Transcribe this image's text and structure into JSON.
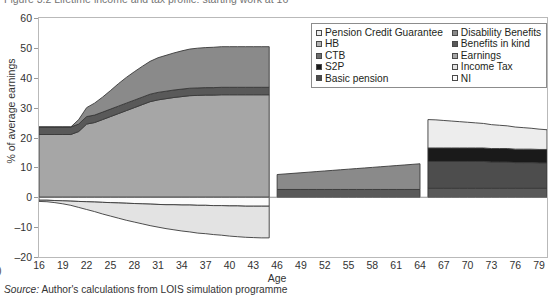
{
  "figure": {
    "caption": "Figure 3.2   Lifetime income and tax profile: starting work at 16",
    "source_prefix": "Source:",
    "source_text": " Author's calculations from LOIS simulation programme",
    "page_marker": ")"
  },
  "chart_data": {
    "type": "area",
    "stacked": true,
    "title": "",
    "xlabel": "Age",
    "ylabel": "% of average earnings",
    "xlim": [
      16,
      80
    ],
    "ylim": [
      -20,
      60
    ],
    "ytick_values": [
      60,
      50,
      40,
      30,
      20,
      10,
      0,
      -10,
      -20
    ],
    "xtick_values": [
      16,
      19,
      22,
      25,
      28,
      31,
      34,
      37,
      40,
      43,
      46,
      49,
      52,
      55,
      58,
      61,
      64,
      67,
      70,
      73,
      76,
      79
    ],
    "grid": false,
    "legend_position": "top-right",
    "colors": {
      "pension_credit_guarantee": "#ededed",
      "hb": "#b3b3b3",
      "ctb": "#6e6e6e",
      "s2p": "#1a1a1a",
      "basic_pension": "#4d4d4d",
      "disability_benefits": "#8a8a8a",
      "benefits_in_kind": "#595959",
      "earnings": "#a6a6a6",
      "income_tax": "#e3e3e3",
      "ni": "#fbfbfb",
      "outline": "#3a3a3a",
      "frame": "#b9b9b9"
    },
    "x": [
      16,
      17,
      18,
      19,
      20,
      21,
      22,
      23,
      24,
      25,
      26,
      27,
      28,
      29,
      30,
      31,
      32,
      33,
      34,
      35,
      36,
      37,
      38,
      39,
      40,
      41,
      42,
      43,
      44,
      45,
      46,
      47,
      48,
      49,
      50,
      51,
      52,
      53,
      54,
      55,
      56,
      57,
      58,
      59,
      60,
      61,
      62,
      63,
      64,
      65,
      66,
      67,
      68,
      69,
      70,
      71,
      72,
      73,
      74,
      75,
      76,
      77,
      78,
      79,
      80
    ],
    "series": [
      {
        "name": "Earnings",
        "key": "earnings",
        "values": [
          21.0,
          21.0,
          21.0,
          21.0,
          21.0,
          22.0,
          24.5,
          25.0,
          26.0,
          27.0,
          28.0,
          29.0,
          30.0,
          31.0,
          32.0,
          32.6,
          33.0,
          33.4,
          33.7,
          34.0,
          34.1,
          34.2,
          34.2,
          34.3,
          34.3,
          34.3,
          34.3,
          34.3,
          34.3,
          34.3,
          0,
          0,
          0,
          0,
          0,
          0,
          0,
          0,
          0,
          0,
          0,
          0,
          0,
          0,
          0,
          0,
          0,
          0,
          0,
          0,
          0,
          0,
          0,
          0,
          0,
          0,
          0,
          0,
          0,
          0,
          0,
          0,
          0,
          0,
          0
        ]
      },
      {
        "name": "Benefits in kind",
        "key": "benefits_in_kind",
        "values": [
          2.5,
          2.5,
          2.5,
          2.5,
          2.5,
          2.5,
          2.5,
          2.5,
          2.5,
          2.5,
          2.5,
          2.5,
          2.5,
          2.5,
          2.5,
          2.5,
          2.5,
          2.5,
          2.5,
          2.5,
          2.5,
          2.5,
          2.5,
          2.5,
          2.5,
          2.5,
          2.5,
          2.5,
          2.5,
          2.5,
          2.6,
          2.6,
          2.6,
          2.6,
          2.6,
          2.6,
          2.6,
          2.6,
          2.6,
          2.6,
          2.6,
          2.6,
          2.6,
          2.6,
          2.6,
          2.6,
          2.6,
          2.6,
          2.6,
          3.0,
          3.0,
          3.0,
          3.0,
          3.0,
          3.0,
          3.0,
          3.0,
          3.0,
          3.0,
          3.0,
          3.0,
          3.0,
          3.0,
          3.0,
          3.0
        ]
      },
      {
        "name": "Disability Benefits",
        "key": "disability_benefits",
        "values": [
          0,
          0,
          0,
          0,
          0,
          1.5,
          3.0,
          4.0,
          5.0,
          6.2,
          7.5,
          8.6,
          9.5,
          10.3,
          11.0,
          11.6,
          12.0,
          12.4,
          12.8,
          13.1,
          13.3,
          13.4,
          13.5,
          13.6,
          13.6,
          13.6,
          13.6,
          13.6,
          13.6,
          13.6,
          5.0,
          5.2,
          5.4,
          5.6,
          5.8,
          6.0,
          6.2,
          6.4,
          6.6,
          6.8,
          7.0,
          7.2,
          7.4,
          7.6,
          7.8,
          8.0,
          8.2,
          8.4,
          8.6,
          0,
          0,
          0,
          0,
          0,
          0,
          0,
          0,
          0,
          0,
          0,
          0,
          0,
          0,
          0,
          0
        ]
      },
      {
        "name": "Basic pension",
        "key": "basic_pension",
        "values": [
          0,
          0,
          0,
          0,
          0,
          0,
          0,
          0,
          0,
          0,
          0,
          0,
          0,
          0,
          0,
          0,
          0,
          0,
          0,
          0,
          0,
          0,
          0,
          0,
          0,
          0,
          0,
          0,
          0,
          0,
          0,
          0,
          0,
          0,
          0,
          0,
          0,
          0,
          0,
          0,
          0,
          0,
          0,
          0,
          0,
          0,
          0,
          0,
          0,
          9.0,
          9.0,
          9.0,
          9.0,
          9.0,
          9.0,
          9.0,
          9.0,
          8.8,
          8.8,
          8.8,
          8.6,
          8.6,
          8.6,
          8.5,
          8.5
        ]
      },
      {
        "name": "S2P",
        "key": "s2p",
        "values": [
          0,
          0,
          0,
          0,
          0,
          0,
          0,
          0,
          0,
          0,
          0,
          0,
          0,
          0,
          0,
          0,
          0,
          0,
          0,
          0,
          0,
          0,
          0,
          0,
          0,
          0,
          0,
          0,
          0,
          0,
          0,
          0,
          0,
          0,
          0,
          0,
          0,
          0,
          0,
          0,
          0,
          0,
          0,
          0,
          0,
          0,
          0,
          0,
          0,
          4.5,
          4.5,
          4.5,
          4.5,
          4.5,
          4.5,
          4.5,
          4.5,
          4.5,
          4.5,
          4.5,
          4.5,
          4.5,
          4.5,
          4.5,
          4.5
        ]
      },
      {
        "name": "Pension Credit Guarantee",
        "key": "pension_credit_guarantee",
        "values": [
          0,
          0,
          0,
          0,
          0,
          0,
          0,
          0,
          0,
          0,
          0,
          0,
          0,
          0,
          0,
          0,
          0,
          0,
          0,
          0,
          0,
          0,
          0,
          0,
          0,
          0,
          0,
          0,
          0,
          0,
          0,
          0,
          0,
          0,
          0,
          0,
          0,
          0,
          0,
          0,
          0,
          0,
          0,
          0,
          0,
          0,
          0,
          0,
          0,
          9.5,
          9.4,
          9.2,
          9.0,
          8.8,
          8.6,
          8.4,
          8.2,
          8.0,
          7.8,
          7.6,
          7.4,
          7.2,
          7.0,
          6.8,
          6.6
        ]
      },
      {
        "name": "HB",
        "key": "hb",
        "values": [
          0,
          0,
          0,
          0,
          0,
          0,
          0,
          0,
          0,
          0,
          0,
          0,
          0,
          0,
          0,
          0,
          0,
          0,
          0,
          0,
          0,
          0,
          0,
          0,
          0,
          0,
          0,
          0,
          0,
          0,
          0,
          0,
          0,
          0,
          0,
          0,
          0,
          0,
          0,
          0,
          0,
          0,
          0,
          0,
          0,
          0,
          0,
          0,
          0,
          0,
          0,
          0,
          0,
          0,
          0,
          0,
          0,
          0,
          0,
          0,
          0,
          0,
          0,
          0,
          0
        ]
      },
      {
        "name": "CTB",
        "key": "ctb",
        "values": [
          0,
          0,
          0,
          0,
          0,
          0,
          0,
          0,
          0,
          0,
          0,
          0,
          0,
          0,
          0,
          0,
          0,
          0,
          0,
          0,
          0,
          0,
          0,
          0,
          0,
          0,
          0,
          0,
          0,
          0,
          0,
          0,
          0,
          0,
          0,
          0,
          0,
          0,
          0,
          0,
          0,
          0,
          0,
          0,
          0,
          0,
          0,
          0,
          0,
          0,
          0,
          0,
          0,
          0,
          0,
          0,
          0,
          0,
          0,
          0,
          0,
          0,
          0,
          0,
          0
        ]
      },
      {
        "name": "NI",
        "key": "ni",
        "values": [
          -1.0,
          -1.0,
          -1.1,
          -1.2,
          -1.3,
          -1.4,
          -1.5,
          -1.6,
          -1.7,
          -1.8,
          -1.9,
          -2.0,
          -2.1,
          -2.2,
          -2.3,
          -2.4,
          -2.5,
          -2.5,
          -2.6,
          -2.6,
          -2.7,
          -2.7,
          -2.8,
          -2.8,
          -2.9,
          -2.9,
          -3.0,
          -3.0,
          -3.0,
          -3.0,
          0,
          0,
          0,
          0,
          0,
          0,
          0,
          0,
          0,
          0,
          0,
          0,
          0,
          0,
          0,
          0,
          0,
          0,
          0,
          0,
          0,
          0,
          0,
          0,
          0,
          0,
          0,
          0,
          0,
          0,
          0,
          0,
          0,
          0,
          0
        ]
      },
      {
        "name": "Income Tax",
        "key": "income_tax",
        "values": [
          -0.4,
          -0.5,
          -0.7,
          -1.0,
          -1.4,
          -2.0,
          -2.6,
          -3.2,
          -3.9,
          -4.5,
          -5.1,
          -5.7,
          -6.2,
          -6.7,
          -7.2,
          -7.6,
          -8.0,
          -8.4,
          -8.7,
          -9.0,
          -9.3,
          -9.5,
          -9.7,
          -9.9,
          -10.1,
          -10.3,
          -10.4,
          -10.5,
          -10.6,
          -10.6,
          0,
          0,
          0,
          0,
          0,
          0,
          0,
          0,
          0,
          0,
          0,
          0,
          0,
          0,
          0,
          0,
          0,
          0,
          0,
          0,
          0,
          0,
          0,
          0,
          0,
          0,
          0,
          0,
          0,
          0,
          0,
          0,
          0,
          0,
          0
        ]
      }
    ]
  },
  "legend": {
    "column1": [
      {
        "label": "Pension Credit Guarantee",
        "key": "pension_credit_guarantee"
      },
      {
        "label": "HB",
        "key": "hb"
      },
      {
        "label": "CTB",
        "key": "ctb"
      },
      {
        "label": "S2P",
        "key": "s2p"
      },
      {
        "label": "Basic pension",
        "key": "basic_pension"
      }
    ],
    "column2": [
      {
        "label": "Disability Benefits",
        "key": "disability_benefits"
      },
      {
        "label": "Benefits in kind",
        "key": "benefits_in_kind"
      },
      {
        "label": "Earnings",
        "key": "earnings"
      },
      {
        "label": "Income Tax",
        "key": "income_tax"
      },
      {
        "label": "NI",
        "key": "ni"
      }
    ]
  }
}
